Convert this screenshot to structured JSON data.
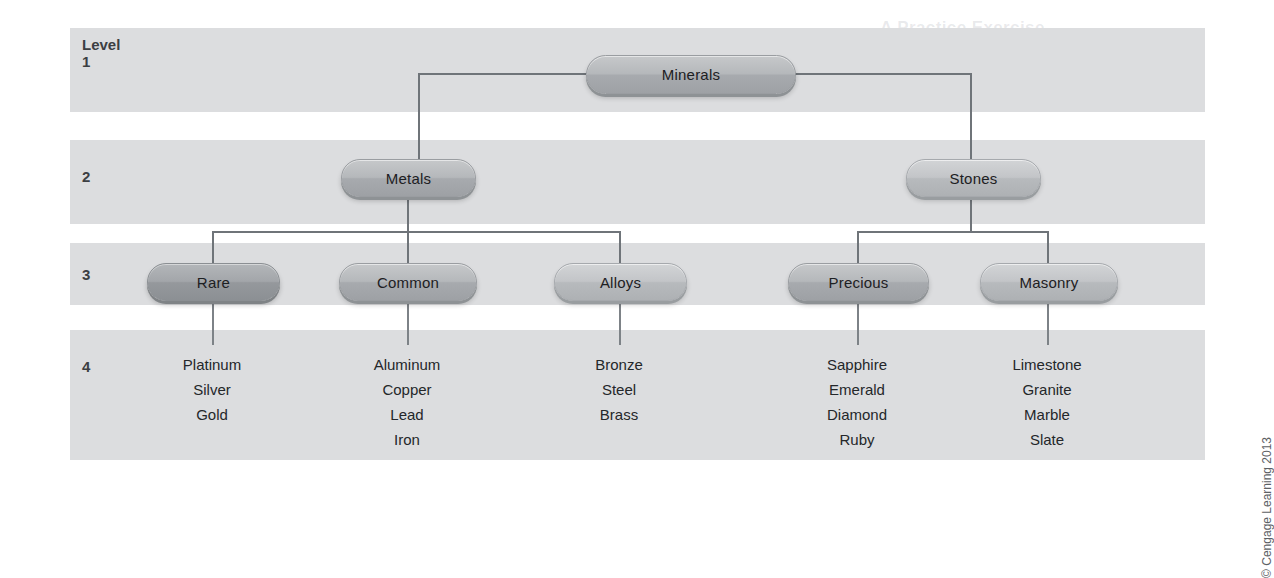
{
  "diagram": {
    "level_label": "Level",
    "levels": [
      {
        "number": "1"
      },
      {
        "number": "2"
      },
      {
        "number": "3"
      },
      {
        "number": "4"
      }
    ],
    "nodes": {
      "root": {
        "label": "Minerals",
        "level": "1"
      },
      "metals": {
        "label": "Metals",
        "level": "2"
      },
      "stones": {
        "label": "Stones",
        "level": "2"
      },
      "rare": {
        "label": "Rare",
        "level": "3"
      },
      "common": {
        "label": "Common",
        "level": "3"
      },
      "alloys": {
        "label": "Alloys",
        "level": "3"
      },
      "precious": {
        "label": "Precious",
        "level": "3"
      },
      "masonry": {
        "label": "Masonry",
        "level": "3"
      }
    },
    "leaves": {
      "rare": [
        "Platinum",
        "Silver",
        "Gold"
      ],
      "common": [
        "Aluminum",
        "Copper",
        "Lead",
        "Iron"
      ],
      "alloys": [
        "Bronze",
        "Steel",
        "Brass"
      ],
      "precious": [
        "Sapphire",
        "Emerald",
        "Diamond",
        "Ruby"
      ],
      "masonry": [
        "Limestone",
        "Granite",
        "Marble",
        "Slate"
      ]
    },
    "credit": "© Cengage Learning 2013",
    "colors": {
      "band": "#dcdddf",
      "node_fill": "#b5b8bb",
      "node_fill_dark": "#a3a6aa",
      "connector": "#6f7479",
      "text": "#1d2023",
      "page": "#ffffff"
    }
  },
  "background_bleed": [
    {
      "text": "A Practice Exercise",
      "x": 880,
      "y": 18,
      "size": 17
    },
    {
      "text": "Completing the Memory Series",
      "x": 880,
      "y": 50,
      "size": 15
    },
    {
      "text": "Recall each item in the list below",
      "x": 430,
      "y": 148,
      "size": 13
    },
    {
      "text": "and write down what you remember",
      "x": 420,
      "y": 176,
      "size": 13
    },
    {
      "text": "the number of items recalled",
      "x": 300,
      "y": 205,
      "size": 13
    },
    {
      "text": "A friend reads the list aloud while you listen, then you repeat back the",
      "x": 100,
      "y": 396,
      "size": 13
    },
    {
      "text": "items you remember. Repeat the exercise using the grouping method.",
      "x": 100,
      "y": 420,
      "size": 13
    }
  ]
}
